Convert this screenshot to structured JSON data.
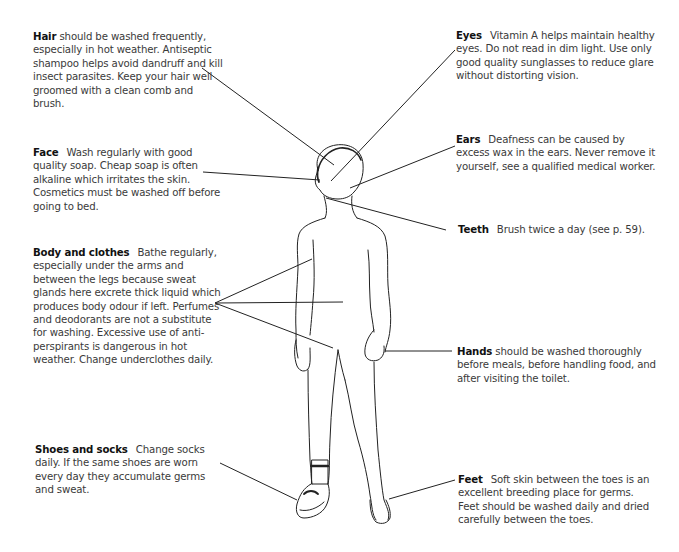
{
  "diagram": {
    "annotations": [
      {
        "id": "hair",
        "heading": "Hair",
        "separator": " ",
        "text": "should be washed frequently, especially in hot weather. Antiseptic shampoo helps avoid dandruff and kill insect parasites. Keep your hair well groomed with a clean comb and brush."
      },
      {
        "id": "eyes",
        "heading": "Eyes",
        "separator": "gap",
        "text": "Vitamin A helps maintain healthy eyes. Do not read in dim light. Use only good quality sunglasses to reduce glare without distorting vision."
      },
      {
        "id": "face",
        "heading": "Face",
        "separator": "gap",
        "text": "Wash regularly with good quality soap. Cheap soap is often alkaline which irritates the skin. Cosmetics must be washed off before going to bed."
      },
      {
        "id": "ears",
        "heading": "Ears",
        "separator": "gap",
        "text": "Deafness can be caused by excess wax in the ears. Never remove it yourself, see a qualified medical worker."
      },
      {
        "id": "teeth",
        "heading": "Teeth",
        "separator": "gap",
        "text": "Brush twice a day (see p. 59)."
      },
      {
        "id": "body",
        "heading": "Body and clothes",
        "separator": "gap",
        "text": "Bathe regularly, especially under the arms and between the legs because sweat glands here excrete thick liquid which produces body odour if left. Perfumes and deodorants are not a substitute for washing. Excessive use of anti-perspirants is dangerous in hot weather. Change underclothes daily."
      },
      {
        "id": "hands",
        "heading": "Hands",
        "separator": " ",
        "text": "should be washed thoroughly before meals, before handling food, and after visiting the toilet."
      },
      {
        "id": "shoes",
        "heading": "Shoes and socks",
        "separator": "gap",
        "text": "Change socks daily. If the same shoes are worn every day they accumulate germs and sweat."
      },
      {
        "id": "feet",
        "heading": "Feet",
        "separator": "gap",
        "text": "Soft skin between the toes is an excellent breeding place for germs. Feet should be washed daily and dried carefully between the toes."
      }
    ],
    "colors": {
      "text": "#3a3a3a",
      "heading": "#111111",
      "line": "#222222",
      "background": "#ffffff"
    }
  }
}
